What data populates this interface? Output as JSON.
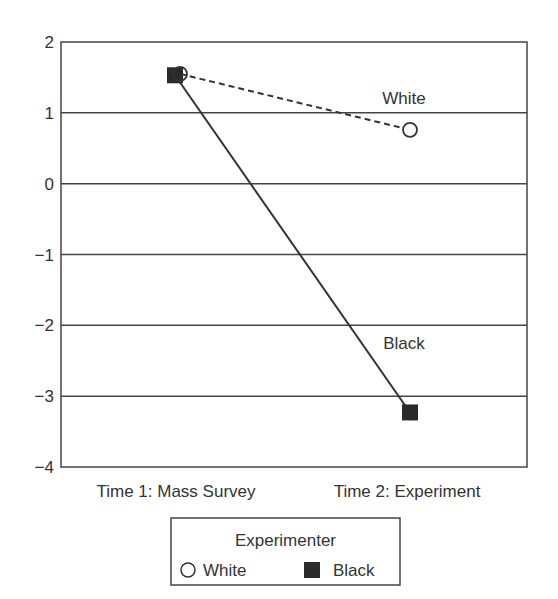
{
  "chart_data": {
    "type": "line",
    "title": "",
    "xlabel": "",
    "ylabel": "",
    "categories": [
      "Time 1: Mass Survey",
      "Time 2: Experiment"
    ],
    "ylim": [
      -4,
      2
    ],
    "yticks": [
      2,
      1,
      0,
      -1,
      -2,
      -3,
      -4
    ],
    "ytick_labels": [
      "2",
      "1",
      "0",
      "−1",
      "−2",
      "−3",
      "−4"
    ],
    "grid": "horizontal",
    "series": [
      {
        "name": "White",
        "values": [
          1.55,
          0.76
        ],
        "marker": "open-circle",
        "line": "dashed",
        "annotation": "White"
      },
      {
        "name": "Black",
        "values": [
          1.53,
          -3.23
        ],
        "marker": "filled-square",
        "line": "solid",
        "annotation": "Black"
      }
    ],
    "legend": {
      "title": "Experimenter",
      "position": "bottom-center",
      "entries": [
        {
          "label": "White",
          "marker": "open-circle"
        },
        {
          "label": "Black",
          "marker": "filled-square"
        }
      ]
    }
  }
}
